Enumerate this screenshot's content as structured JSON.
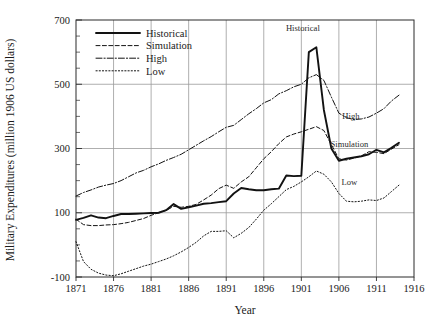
{
  "chart_data": {
    "type": "line",
    "title": "",
    "xlabel": "Year",
    "ylabel": "Military Expenditures (million 1906 US dollars)",
    "xlim": [
      1871,
      1916
    ],
    "ylim": [
      -100,
      700
    ],
    "xticks": [
      1871,
      1876,
      1881,
      1886,
      1891,
      1896,
      1901,
      1906,
      1911,
      1916
    ],
    "xtick_labels": [
      "1871",
      "1876",
      "1881",
      "1886",
      "1891",
      "1896",
      "1901",
      "1906",
      "1911",
      "1916"
    ],
    "yticks": [
      -100,
      100,
      300,
      500,
      700
    ],
    "ytick_labels": [
      "-100",
      "100",
      "300",
      "500",
      "700"
    ],
    "y_minor_step": 50,
    "grid": true,
    "grid_color": "#9a9a9a",
    "legend_position": "upper-left-inside",
    "legend_entries": [
      {
        "label": "Historical",
        "style": "solid"
      },
      {
        "label": "Simulation",
        "style": "dashed"
      },
      {
        "label": "High",
        "style": "dash-dot"
      },
      {
        "label": "Low",
        "style": "dotted"
      }
    ],
    "annotations": [
      {
        "text": "Historical",
        "x": 1901.2,
        "y": 665
      },
      {
        "text": "High",
        "x": 1907.6,
        "y": 392
      },
      {
        "text": "Simulation",
        "x": 1907.4,
        "y": 305
      },
      {
        "text": "Low",
        "x": 1907.4,
        "y": 185
      }
    ],
    "series": [
      {
        "name": "Historical",
        "style": "solid",
        "x": [
          1871,
          1872,
          1873,
          1874,
          1875,
          1876,
          1877,
          1878,
          1879,
          1880,
          1881,
          1882,
          1883,
          1884,
          1885,
          1886,
          1887,
          1888,
          1889,
          1890,
          1891,
          1892,
          1893,
          1894,
          1895,
          1896,
          1897,
          1898,
          1899,
          1900,
          1901,
          1902,
          1903,
          1904,
          1905,
          1906,
          1907,
          1908,
          1909,
          1910,
          1911,
          1912,
          1913,
          1914
        ],
        "y": [
          78,
          84,
          92,
          85,
          83,
          90,
          96,
          96,
          97,
          98,
          99,
          100,
          108,
          127,
          112,
          117,
          122,
          128,
          130,
          133,
          136,
          160,
          177,
          173,
          170,
          170,
          173,
          175,
          216,
          214,
          215,
          600,
          615,
          420,
          300,
          262,
          268,
          272,
          276,
          282,
          296,
          288,
          302,
          318
        ],
        "label": "Historical"
      },
      {
        "name": "Simulation",
        "style": "dashed",
        "x": [
          1871,
          1872,
          1873,
          1874,
          1875,
          1876,
          1877,
          1878,
          1879,
          1880,
          1881,
          1882,
          1883,
          1884,
          1885,
          1886,
          1887,
          1888,
          1889,
          1890,
          1891,
          1892,
          1893,
          1894,
          1895,
          1896,
          1897,
          1898,
          1899,
          1900,
          1901,
          1902,
          1903,
          1904,
          1905,
          1906,
          1907,
          1908,
          1909,
          1910,
          1911,
          1912,
          1913,
          1914
        ],
        "y": [
          80,
          63,
          60,
          60,
          62,
          63,
          66,
          70,
          76,
          82,
          92,
          100,
          107,
          120,
          117,
          120,
          126,
          140,
          155,
          175,
          186,
          176,
          196,
          212,
          240,
          268,
          290,
          315,
          336,
          345,
          352,
          360,
          368,
          356,
          312,
          268,
          264,
          270,
          277,
          290,
          288,
          284,
          298,
          312
        ],
        "label": "Simulation"
      },
      {
        "name": "High",
        "style": "dash-dot",
        "x": [
          1871,
          1872,
          1873,
          1874,
          1875,
          1876,
          1877,
          1878,
          1879,
          1880,
          1881,
          1882,
          1883,
          1884,
          1885,
          1886,
          1887,
          1888,
          1889,
          1890,
          1891,
          1892,
          1893,
          1894,
          1895,
          1896,
          1897,
          1898,
          1899,
          1900,
          1901,
          1902,
          1903,
          1904,
          1905,
          1906,
          1907,
          1908,
          1909,
          1910,
          1911,
          1912,
          1913,
          1914
        ],
        "y": [
          152,
          163,
          171,
          180,
          186,
          191,
          200,
          212,
          224,
          232,
          243,
          252,
          263,
          272,
          282,
          296,
          310,
          324,
          337,
          352,
          366,
          372,
          390,
          408,
          424,
          442,
          452,
          470,
          480,
          492,
          500,
          520,
          530,
          512,
          460,
          410,
          396,
          390,
          392,
          398,
          410,
          424,
          448,
          466
        ],
        "label": "High"
      },
      {
        "name": "Low",
        "style": "dotted",
        "x": [
          1871,
          1872,
          1873,
          1874,
          1875,
          1876,
          1877,
          1878,
          1879,
          1880,
          1881,
          1882,
          1883,
          1884,
          1885,
          1886,
          1887,
          1888,
          1889,
          1890,
          1891,
          1892,
          1893,
          1894,
          1895,
          1896,
          1897,
          1898,
          1899,
          1900,
          1901,
          1902,
          1903,
          1904,
          1905,
          1906,
          1907,
          1908,
          1909,
          1910,
          1911,
          1912,
          1913,
          1914
        ],
        "y": [
          10,
          -52,
          -76,
          -88,
          -94,
          -96,
          -90,
          -82,
          -74,
          -66,
          -60,
          -52,
          -44,
          -34,
          -22,
          -8,
          8,
          28,
          42,
          42,
          44,
          22,
          36,
          54,
          80,
          108,
          128,
          150,
          172,
          182,
          196,
          212,
          230,
          220,
          196,
          160,
          136,
          134,
          136,
          140,
          138,
          146,
          166,
          186
        ],
        "label": "Low"
      }
    ]
  }
}
